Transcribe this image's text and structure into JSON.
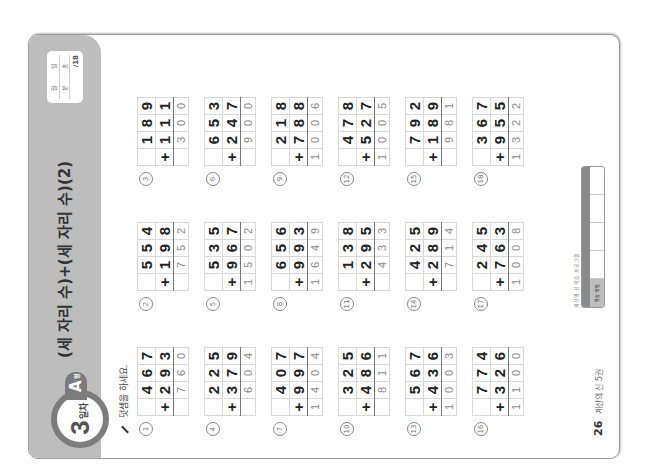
{
  "header": {
    "day_number": "3",
    "day_label": "일차",
    "level_tab": "A",
    "level_suffix": "형",
    "title": "(세 자리 수)+(세 자리 수)(2)",
    "score_box": {
      "month": "월",
      "day": "일",
      "minute": "분",
      "second": "초",
      "total": "/18"
    }
  },
  "instruction": "덧셈을 하세요.",
  "problems": [
    {
      "n": "1",
      "top": [
        "4",
        "6",
        "7"
      ],
      "bottom": [
        "2",
        "9",
        "3"
      ],
      "answer": [
        "",
        "7",
        "6",
        "0"
      ]
    },
    {
      "n": "2",
      "top": [
        "5",
        "5",
        "4"
      ],
      "bottom": [
        "1",
        "9",
        "8"
      ],
      "answer": [
        "",
        "7",
        "5",
        "2"
      ]
    },
    {
      "n": "3",
      "top": [
        "1",
        "8",
        "9"
      ],
      "bottom": [
        "1",
        "1",
        "1"
      ],
      "answer": [
        "",
        "3",
        "0",
        "0"
      ]
    },
    {
      "n": "4",
      "top": [
        "2",
        "2",
        "5"
      ],
      "bottom": [
        "3",
        "7",
        "9"
      ],
      "answer": [
        "",
        "6",
        "0",
        "4"
      ]
    },
    {
      "n": "5",
      "top": [
        "5",
        "3",
        "5"
      ],
      "bottom": [
        "9",
        "6",
        "7"
      ],
      "answer": [
        "1",
        "5",
        "0",
        "2"
      ]
    },
    {
      "n": "6",
      "top": [
        "6",
        "5",
        "3"
      ],
      "bottom": [
        "2",
        "4",
        "7"
      ],
      "answer": [
        "",
        "9",
        "0",
        "0"
      ]
    },
    {
      "n": "7",
      "top": [
        "4",
        "0",
        "7"
      ],
      "bottom": [
        "9",
        "9",
        "7"
      ],
      "answer": [
        "1",
        "4",
        "0",
        "4"
      ]
    },
    {
      "n": "8",
      "top": [
        "6",
        "5",
        "6"
      ],
      "bottom": [
        "9",
        "9",
        "3"
      ],
      "answer": [
        "1",
        "6",
        "4",
        "9"
      ]
    },
    {
      "n": "9",
      "top": [
        "2",
        "1",
        "8"
      ],
      "bottom": [
        "7",
        "8",
        "8"
      ],
      "answer": [
        "1",
        "0",
        "0",
        "6"
      ]
    },
    {
      "n": "10",
      "top": [
        "3",
        "2",
        "5"
      ],
      "bottom": [
        "4",
        "8",
        "6"
      ],
      "answer": [
        "",
        "8",
        "1",
        "1"
      ]
    },
    {
      "n": "11",
      "top": [
        "1",
        "3",
        "8"
      ],
      "bottom": [
        "2",
        "9",
        "5"
      ],
      "answer": [
        "",
        "4",
        "3",
        "3"
      ]
    },
    {
      "n": "12",
      "top": [
        "4",
        "7",
        "8"
      ],
      "bottom": [
        "5",
        "2",
        "7"
      ],
      "answer": [
        "1",
        "0",
        "0",
        "5"
      ]
    },
    {
      "n": "13",
      "top": [
        "5",
        "6",
        "7"
      ],
      "bottom": [
        "4",
        "3",
        "6"
      ],
      "answer": [
        "1",
        "0",
        "0",
        "3"
      ]
    },
    {
      "n": "14",
      "top": [
        "4",
        "2",
        "5"
      ],
      "bottom": [
        "2",
        "8",
        "9"
      ],
      "answer": [
        "",
        "7",
        "1",
        "4"
      ]
    },
    {
      "n": "15",
      "top": [
        "7",
        "9",
        "2"
      ],
      "bottom": [
        "1",
        "8",
        "9"
      ],
      "answer": [
        "",
        "9",
        "8",
        "1"
      ]
    },
    {
      "n": "16",
      "top": [
        "7",
        "7",
        "4"
      ],
      "bottom": [
        "3",
        "2",
        "6"
      ],
      "answer": [
        "1",
        "1",
        "0",
        "0"
      ]
    },
    {
      "n": "17",
      "top": [
        "2",
        "4",
        "5"
      ],
      "bottom": [
        "7",
        "6",
        "3"
      ],
      "answer": [
        "1",
        "0",
        "0",
        "8"
      ]
    },
    {
      "n": "18",
      "top": [
        "3",
        "6",
        "7"
      ],
      "bottom": [
        "9",
        "5",
        "5"
      ],
      "answer": [
        "1",
        "3",
        "2",
        "2"
      ]
    }
  ],
  "operator": "+",
  "footer": {
    "page_number": "26",
    "book_title": "계산의 신 5권",
    "brand": "계산의 신 학습 프로그램",
    "level_table": {
      "headers": [
        "",
        "",
        "",
        "",
        ""
      ],
      "cells": [
        "학습 방법",
        "",
        "",
        "",
        ""
      ]
    }
  }
}
